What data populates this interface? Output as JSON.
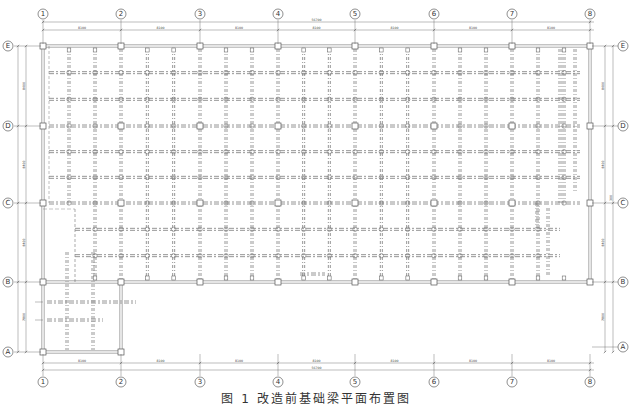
{
  "figure": {
    "caption": "图 1   改造前基础梁平面布置图"
  },
  "column_axes": [
    {
      "label": "①",
      "x": 43
    },
    {
      "label": "②",
      "x": 121
    },
    {
      "label": "③",
      "x": 200
    },
    {
      "label": "④",
      "x": 278
    },
    {
      "label": "⑤",
      "x": 355
    },
    {
      "label": "⑥",
      "x": 434
    },
    {
      "label": "⑦",
      "x": 512
    },
    {
      "label": "⑧",
      "x": 590
    }
  ],
  "row_axes": [
    {
      "label": "Ⓔ",
      "y": 46
    },
    {
      "label": "Ⓓ",
      "y": 126
    },
    {
      "label": "Ⓒ",
      "y": 203
    },
    {
      "label": "Ⓑ",
      "y": 282
    },
    {
      "label": "Ⓐ",
      "y": 352
    }
  ],
  "dimensions": {
    "top_total": "56700",
    "top_spans": [
      "8100",
      "8100",
      "8100",
      "8100",
      "8100",
      "8100",
      "8100"
    ],
    "bottom_total": "56700",
    "bottom_spans": [
      "8100",
      "8100",
      "8100",
      "8100",
      "8100",
      "8100",
      "8100"
    ],
    "left_spans": [
      "8400",
      "8400",
      "8400",
      "7800"
    ],
    "right_spans": [
      "8400",
      "8400",
      "8400",
      "7800"
    ],
    "right_small": "300"
  },
  "colors": {
    "line": "#555555",
    "beam": "#8a8a8a",
    "background": "#ffffff"
  }
}
